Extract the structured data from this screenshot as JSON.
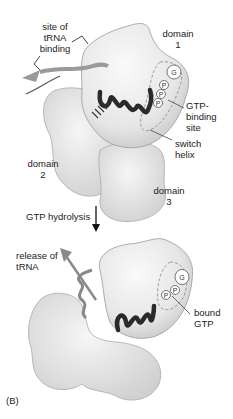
{
  "figure": {
    "panel_label": "(B)",
    "top_state": {
      "labels": {
        "trna_site": [
          "site of",
          "tRNA",
          "binding"
        ],
        "domain1": [
          "domain",
          "1"
        ],
        "domain2": [
          "domain",
          "2"
        ],
        "domain3": [
          "domain",
          "3"
        ],
        "gtp_site": [
          "GTP-",
          "binding",
          "site"
        ],
        "switch_helix": [
          "switch",
          "helix"
        ]
      },
      "nucleotide": [
        "G",
        "P",
        "P",
        "P"
      ]
    },
    "transition": {
      "label": "GTP hydrolysis"
    },
    "bottom_state": {
      "labels": {
        "release": [
          "release of",
          "tRNA"
        ],
        "bound": [
          "bound",
          "GTP"
        ]
      },
      "nucleotide": [
        "G",
        "P",
        "P"
      ]
    }
  }
}
